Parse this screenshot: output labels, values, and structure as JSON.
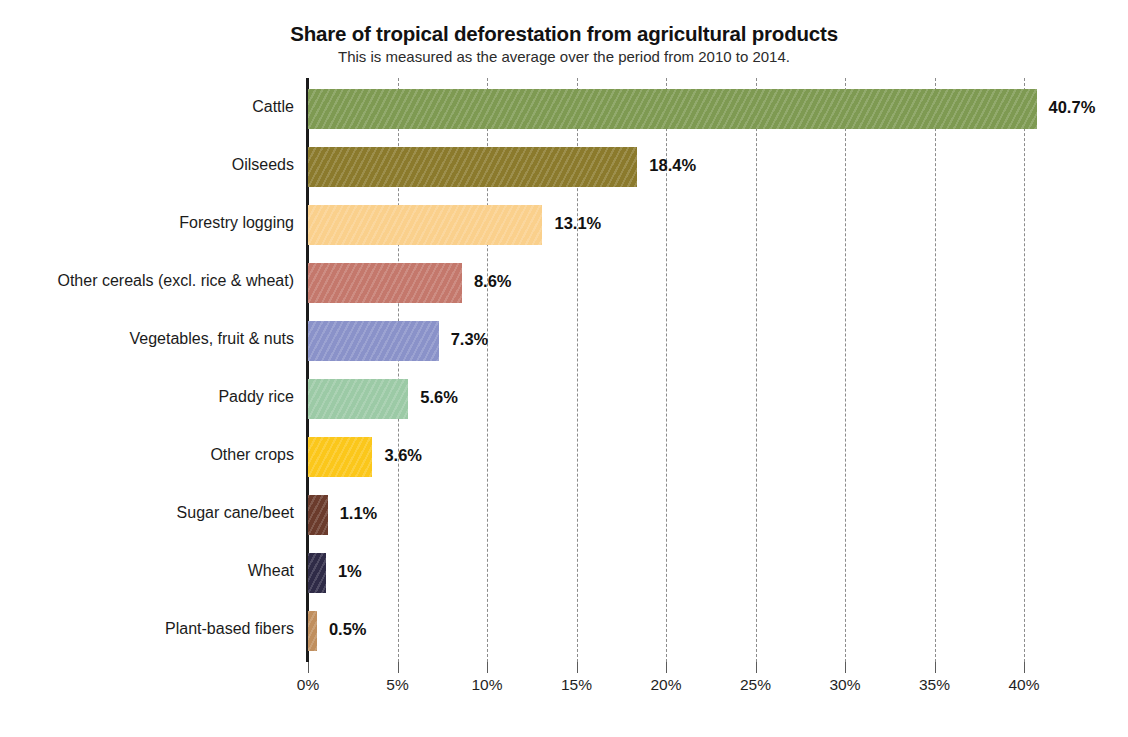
{
  "chart_data": {
    "type": "bar",
    "orientation": "horizontal",
    "title": "Share of tropical deforestation from agricultural products",
    "subtitle": "This is measured as the average over the period from 2010 to 2014.",
    "xlabel": "",
    "ylabel": "",
    "xlim": [
      0,
      40
    ],
    "grid": true,
    "legend": "none",
    "x_tick_labels": [
      "0%",
      "5%",
      "10%",
      "15%",
      "20%",
      "25%",
      "30%",
      "35%",
      "40%"
    ],
    "x_tick_values": [
      0,
      5,
      10,
      15,
      20,
      25,
      30,
      35,
      40
    ],
    "categories": [
      "Cattle",
      "Oilseeds",
      "Forestry logging",
      "Other cereals (excl. rice & wheat)",
      "Vegetables, fruit & nuts",
      "Paddy rice",
      "Other crops",
      "Sugar cane/beet",
      "Wheat",
      "Plant-based fibers"
    ],
    "values": [
      40.7,
      18.4,
      13.1,
      8.6,
      7.3,
      5.6,
      3.6,
      1.1,
      1.0,
      0.5
    ],
    "value_labels": [
      "40.7%",
      "18.4%",
      "13.1%",
      "8.6%",
      "7.3%",
      "5.6%",
      "3.6%",
      "1.1%",
      "1%",
      "0.5%"
    ],
    "colors": [
      "#7e9a52",
      "#8b7a2c",
      "#fad08c",
      "#c4786c",
      "#8a92c9",
      "#9ccaa6",
      "#fbc71b",
      "#6b3b2c",
      "#2f2b47",
      "#c08f5e"
    ]
  }
}
